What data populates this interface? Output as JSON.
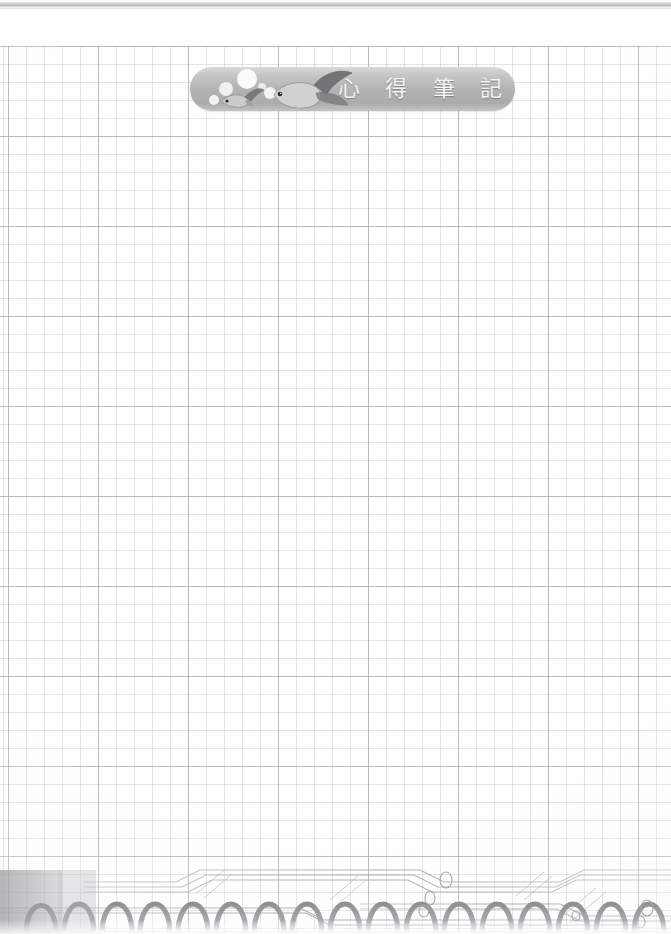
{
  "page": {
    "kind": "grid-notebook-page",
    "width": 671,
    "height": 934,
    "background_color": "#ffffff",
    "grid_minor_color": "#b2bac4",
    "grid_major_color": "#96989e",
    "grid_minor_spacing_px": 18,
    "grid_major_spacing_px": 90,
    "body_text": ""
  },
  "top_edge": {
    "name": "page-edge-shadow",
    "color": "#b8b8b8"
  },
  "banner": {
    "shape": "rounded-pill",
    "fill_color": "#b4b4b4",
    "text_color": "#f4f4f4",
    "title_characters": [
      "心",
      "得",
      "筆",
      "記"
    ],
    "title": "心得筆記",
    "artwork": {
      "name": "goldfish-illustration",
      "elements": [
        "small-goldfish",
        "large-goldfish",
        "bubbles"
      ],
      "bubble_count": 5,
      "fish_count": 2,
      "ink_color": "#8f9094"
    }
  },
  "bottom_decoration": {
    "name": "spiral-binding-graphic",
    "coil_count": 17,
    "coil_color": "#9a9ca0",
    "accent_line_color": "#a9abb0",
    "circle_count": 6,
    "block_color": "#96989b"
  }
}
